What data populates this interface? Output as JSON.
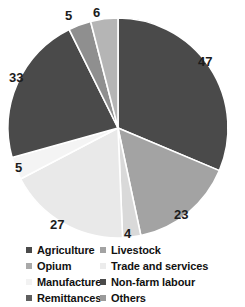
{
  "chart_data": {
    "type": "pie",
    "title": "",
    "subtitle": "",
    "xlabel": "",
    "ylabel": "",
    "legend_position": "bottom",
    "grid": false,
    "start_angle_deg": 0,
    "direction": "clockwise",
    "categories": [
      "Agriculture",
      "Livestock",
      "Opium",
      "Trade and services",
      "Manufacture",
      "Non-farm labour",
      "Remittances",
      "Others"
    ],
    "values": [
      47,
      23,
      4,
      27,
      5,
      33,
      5,
      6
    ],
    "value_labels": [
      "47",
      "23",
      "4",
      "27",
      "5",
      "33",
      "5",
      "6"
    ],
    "colors": [
      "#4a4a4a",
      "#a3a3a3",
      "#d9d9d9",
      "#e9e9e9",
      "#f4f4f4",
      "#4a4a4a",
      "#8f8f8f",
      "#b5b5b5"
    ],
    "slice_border_color": "#ffffff",
    "total": 150
  },
  "labels": [
    {
      "name": "slice-value-agriculture",
      "text": "47",
      "x": 198,
      "y": 55
    },
    {
      "name": "slice-value-livestock",
      "text": "23",
      "x": 174,
      "y": 208
    },
    {
      "name": "slice-value-opium",
      "text": "4",
      "x": 124,
      "y": 227
    },
    {
      "name": "slice-value-trade",
      "text": "27",
      "x": 50,
      "y": 218
    },
    {
      "name": "slice-value-manufacture",
      "text": "5",
      "x": 15,
      "y": 161
    },
    {
      "name": "slice-value-nonfarm",
      "text": "33",
      "x": 9,
      "y": 71
    },
    {
      "name": "slice-value-remittances",
      "text": "5",
      "x": 65,
      "y": 9
    },
    {
      "name": "slice-value-others",
      "text": "6",
      "x": 93,
      "y": 6
    }
  ],
  "legend": {
    "rows": [
      {
        "left": {
          "label": "Agriculture",
          "color": "#4a4a4a",
          "swatch_name": "legend-swatch-agriculture"
        },
        "right": {
          "label": "Livestock",
          "color": "#a3a3a3",
          "swatch_name": "legend-swatch-livestock"
        }
      },
      {
        "left": {
          "label": "Opium",
          "color": "#a9a9a9",
          "swatch_name": "legend-swatch-opium"
        },
        "right": {
          "label": "Trade and services",
          "color": "#ececec",
          "swatch_name": "legend-swatch-trade-and-services"
        }
      },
      {
        "left": {
          "label": "Manufacture",
          "color": "#f2f2f2",
          "swatch_name": "legend-swatch-manufacture"
        },
        "right": {
          "label": "Non-farm labour",
          "color": "#4a4a4a",
          "swatch_name": "legend-swatch-non-farm-labour"
        }
      },
      {
        "left": {
          "label": "Remittances",
          "color": "#5f5f5f",
          "swatch_name": "legend-swatch-remittances"
        },
        "right": {
          "label": "Others",
          "color": "#9a9a9a",
          "swatch_name": "legend-swatch-others"
        }
      }
    ]
  }
}
